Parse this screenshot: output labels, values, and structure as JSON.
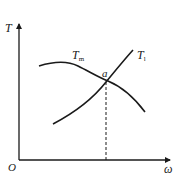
{
  "diagram": {
    "type": "torque-speed characteristic",
    "axes": {
      "y_label": "T",
      "x_label": "ω",
      "origin_label": "O"
    },
    "curves": [
      {
        "id": "motor",
        "label_main": "T",
        "label_sub": "m"
      },
      {
        "id": "load",
        "label_main": "T",
        "label_sub": "l"
      }
    ],
    "intersection": {
      "label": "a"
    },
    "colors": {
      "line": "#1a1a1a",
      "background": "#ffffff"
    }
  }
}
